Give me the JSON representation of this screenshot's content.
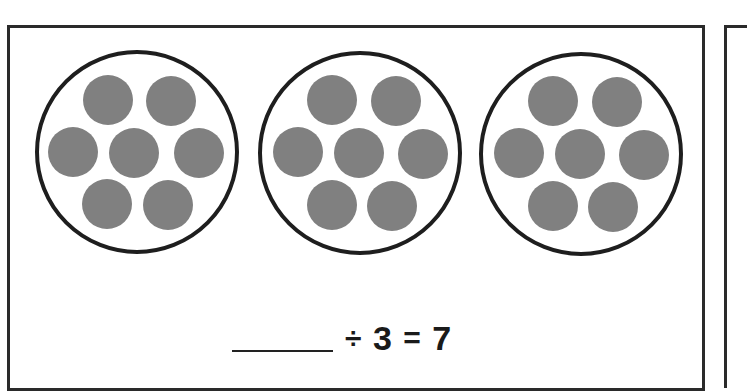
{
  "worksheet": {
    "type": "division-from-grouping",
    "groups": [
      {
        "label": "group-1",
        "dot_count": 7
      },
      {
        "label": "group-2",
        "dot_count": 7
      },
      {
        "label": "group-3",
        "dot_count": 7
      }
    ],
    "equation": {
      "blank": "______",
      "divide_symbol": "÷",
      "divisor": "3",
      "equals_symbol": "=",
      "quotient": "7"
    },
    "colors": {
      "dot_fill": "#808080",
      "ring_stroke": "#1e1e1e",
      "frame_stroke": "#2a2a2a",
      "text": "#1a1a1a",
      "background": "#ffffff"
    }
  }
}
